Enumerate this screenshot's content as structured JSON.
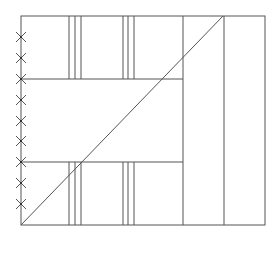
{
  "diagram": {
    "stroke_color": "#555555",
    "background": "#ffffff",
    "frame": {
      "x1": 21,
      "y1": 16,
      "x2": 265,
      "y2": 225
    },
    "horizontal_lines": [
      {
        "y": 79,
        "x1": 21,
        "x2": 183
      },
      {
        "y": 162,
        "x1": 21,
        "x2": 183
      }
    ],
    "vertical_line_groups": [
      {
        "xs": [
          69,
          75,
          81
        ],
        "segments": [
          [
            16,
            79
          ],
          [
            162,
            225
          ]
        ]
      },
      {
        "xs": [
          123,
          128,
          134
        ],
        "segments": [
          [
            16,
            79
          ],
          [
            162,
            225
          ]
        ]
      }
    ],
    "full_vertical_lines": [
      183,
      224
    ],
    "diagonal": {
      "x1": 21,
      "y1": 225,
      "x2": 223,
      "y2": 16
    },
    "x_markers": {
      "x": 21,
      "ys": [
        37,
        58,
        79,
        100,
        121,
        141,
        162,
        183,
        204
      ],
      "size": 5
    }
  }
}
